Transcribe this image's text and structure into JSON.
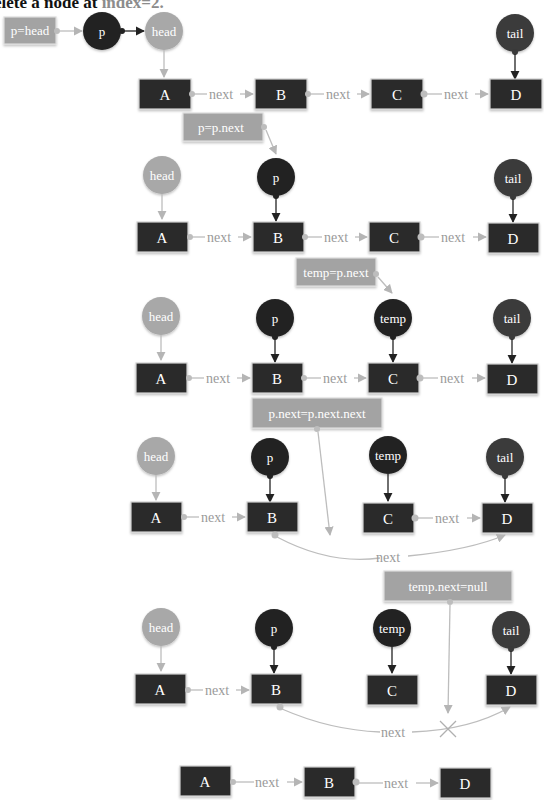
{
  "title": {
    "prefix": "elete a node at ",
    "highlight": "index=2."
  },
  "colors": {
    "node_fill": "#2b2b2b",
    "head_fill": "#a8a8a8",
    "p_fill": "#222222",
    "tail_fill": "#3a3a3a",
    "op_fill": "#a3a3a3",
    "edge": "#bdbdbd",
    "label": "#9a9a9a"
  },
  "steps": [
    {
      "op": "p=head",
      "pointers": [
        {
          "label": "p"
        },
        {
          "label": "head"
        },
        {
          "label": "tail"
        }
      ],
      "nodes": [
        "A",
        "B",
        "C",
        "D"
      ],
      "edges": [
        "next",
        "next",
        "next"
      ]
    },
    {
      "op": "p=p.next",
      "pointers": [
        {
          "label": "head"
        },
        {
          "label": "p"
        },
        {
          "label": "tail"
        }
      ],
      "nodes": [
        "A",
        "B",
        "C",
        "D"
      ],
      "edges": [
        "next",
        "next",
        "next"
      ]
    },
    {
      "op": "temp=p.next",
      "pointers": [
        {
          "label": "head"
        },
        {
          "label": "p"
        },
        {
          "label": "temp"
        },
        {
          "label": "tail"
        }
      ],
      "nodes": [
        "A",
        "B",
        "C",
        "D"
      ],
      "edges": [
        "next",
        "next",
        "next"
      ]
    },
    {
      "op": "p.next=p.next.next",
      "pointers": [
        {
          "label": "head"
        },
        {
          "label": "p"
        },
        {
          "label": "temp"
        },
        {
          "label": "tail"
        }
      ],
      "nodes": [
        "A",
        "B",
        "C",
        "D"
      ],
      "edges": [
        "next",
        "next",
        "next"
      ]
    },
    {
      "op": "temp.next=null",
      "pointers": [
        {
          "label": "head"
        },
        {
          "label": "p"
        },
        {
          "label": "temp"
        },
        {
          "label": "tail"
        }
      ],
      "nodes": [
        "A",
        "B",
        "C",
        "D"
      ],
      "edges": [
        "next",
        "next"
      ]
    },
    {
      "op": "",
      "pointers": [],
      "nodes": [
        "A",
        "B",
        "D"
      ],
      "edges": [
        "next",
        "next"
      ]
    }
  ]
}
